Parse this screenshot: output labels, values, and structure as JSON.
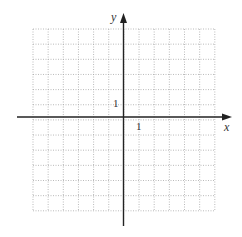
{
  "diagram": {
    "type": "coordinate-grid",
    "x_axis_label": "x",
    "y_axis_label": "y",
    "x_tick_label": "1",
    "y_tick_label": "1",
    "grid": {
      "columns": 12,
      "rows": 12,
      "x_range": [
        -6,
        6
      ],
      "y_range": [
        -6,
        6
      ],
      "unit": 1,
      "line_style": "dotted"
    },
    "colors": {
      "grid": "#a8a8a8",
      "axes": "#222222",
      "labels": "#333333",
      "background": "#ffffff"
    }
  }
}
